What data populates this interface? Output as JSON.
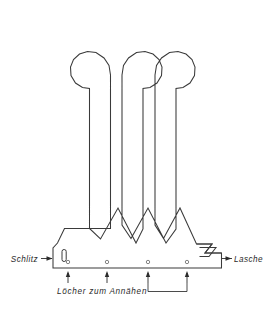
{
  "figure": {
    "ink_color": "#3a3a3a",
    "background_color": "#ffffff",
    "label_color": "#2b2b2b"
  },
  "callouts": {
    "left": {
      "label": "Schlitz",
      "target": "slot"
    },
    "right": {
      "label": "Lasche",
      "target": "tab"
    }
  },
  "caption": {
    "label": "Löcher zum Annähen",
    "arrow_count": 4
  },
  "holes": [
    {
      "index": 1,
      "cx": 68,
      "cy": 262
    },
    {
      "index": 2,
      "cx": 107,
      "cy": 262
    },
    {
      "index": 3,
      "cx": 148,
      "cy": 262
    },
    {
      "index": 4,
      "cx": 187,
      "cy": 262
    }
  ],
  "arrows": [
    {
      "index": 1,
      "x": 68
    },
    {
      "index": 2,
      "x": 107
    },
    {
      "index": 3,
      "x": 148
    },
    {
      "index": 4,
      "x": 187
    }
  ],
  "bracket": {
    "from_x": 148,
    "to_x": 187,
    "y": 288
  },
  "shape": {
    "outline_path": "M 64.5 228.5 L 57.5 243.0 L 53.0 248.0 L 53.0 268.0 L 221.5 268.0 L 221.5 253.0 L 205.0 253.0 L 212.0 244.0 L 196.5 244.0 L 180.0 208.0 L 163.5 238.5 L 155.0 225.0 L 155.0 75.0 L 156.5 65.5 L 161.5 58.0 L 169.5 52.5 L 178.0 51.5 L 186.0 54.0 L 192.0 59.5 L 195.0 67.0 L 194.5 75.5 L 190.0 83.0 L 183.0 87.5 L 176.0 88.5 L 176.0 229.0 L 166.0 243.0 L 148.0 208.0 L 131.0 238.5 L 122.0 225.0 L 122.0 75.0 L 123.5 65.5 L 128.5 58.0 L 136.5 52.5 L 145.0 51.5 L 153.0 54.0 L 159.0 59.5 L 162.0 67.0 L 161.5 75.5 L 157.0 83.0 L 150.0 87.5 L 143.0 88.5 L 143.0 229.0 L 136.0 243.0 L 118.0 208.0 L 100.5 239.0 L 89.5 228.5 L 89.5 88.5 L 82.5 87.5 L 75.5 83.0 L 71.0 75.5 L 70.5 67.0 L 73.5 59.5 L 79.5 54.0 L 87.5 51.5 L 96.0 52.5 L 104.0 58.0 L 109.0 65.5 L 110.5 75.0 L 110.5 228.5 Z",
    "tab_path": "M 196.5 244.0 L 212.0 244.0 L 205.0 253.0 L 221.5 253.0",
    "tab_inner_path": "M 199.5 247.5 L 216.0 247.5 L 209.0 256.5 L 199.5 256.5",
    "slot": {
      "x": 62.0,
      "y": 249.5,
      "width": 4.2,
      "height": 12.0,
      "rx": 2.0
    }
  }
}
